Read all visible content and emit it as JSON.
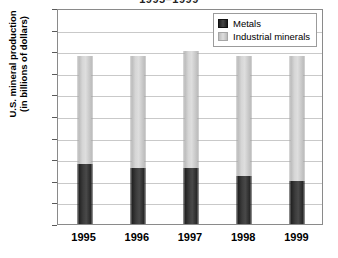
{
  "chart_data": {
    "type": "bar",
    "subtype": "stacked-column",
    "title": "1995–1999",
    "xlabel": "",
    "ylabel": "U.S. mineral production (in billions of dollars)",
    "ylabel_line1": "U.S. mineral production",
    "ylabel_line2": "(in billions of dollars)",
    "categories": [
      "1995",
      "1996",
      "1997",
      "1998",
      "1999"
    ],
    "series": [
      {
        "name": "Metals",
        "color": "#2e2e2e",
        "values": [
          14,
          13,
          13,
          11,
          10
        ]
      },
      {
        "name": "Industrial minerals",
        "color": "#d3d3d3",
        "values": [
          25,
          26,
          27,
          28,
          29
        ]
      }
    ],
    "totals": [
      39,
      39,
      40,
      39,
      39
    ],
    "ylim": [
      0,
      50
    ],
    "yticks": [
      0,
      5,
      10,
      15,
      20,
      25,
      30,
      35,
      40,
      45,
      50
    ],
    "ytick_labels": [
      "0",
      "5",
      "10",
      "15",
      "20",
      "25",
      "30",
      "35",
      "40",
      "45",
      "50"
    ],
    "grid": true,
    "legend_position": "top-right",
    "legend_entries": [
      "Metals",
      "Industrial minerals"
    ]
  }
}
